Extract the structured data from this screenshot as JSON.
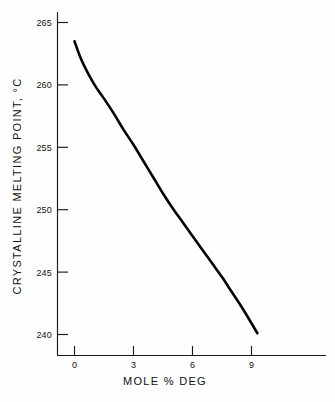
{
  "chart_data": {
    "type": "line",
    "title": "",
    "xlabel": "MOLE % DEG",
    "ylabel": "CRYSTALLINE MELTING POINT, °C",
    "xlim": [
      -0.9,
      10.2
    ],
    "ylim": [
      238.0,
      266.2
    ],
    "grid": false,
    "legend": null,
    "xticks": [
      0,
      3,
      6,
      9
    ],
    "xtick_labels": [
      "0",
      "3",
      "6",
      "9"
    ],
    "yticks": [
      240,
      245,
      250,
      255,
      260,
      265
    ],
    "ytick_labels": [
      "240",
      "245",
      "250",
      "255",
      "260",
      "265"
    ],
    "series": [
      {
        "name": "crystalline melting point",
        "color": "#050505",
        "x": [
          0.0,
          0.25,
          0.5,
          0.8,
          1.1,
          1.5,
          2.0,
          2.5,
          3.0,
          3.5,
          4.0,
          4.5,
          5.0,
          5.5,
          6.0,
          6.5,
          7.0,
          7.5,
          8.0,
          8.5,
          9.0,
          9.3
        ],
        "y": [
          263.5,
          262.4,
          261.5,
          260.6,
          259.8,
          258.9,
          257.7,
          256.4,
          255.2,
          253.9,
          252.6,
          251.3,
          250.1,
          249.0,
          247.9,
          246.8,
          245.7,
          244.6,
          243.4,
          242.2,
          240.9,
          240.1
        ]
      }
    ]
  },
  "axes": {
    "x_axis_label": "MOLE % DEG",
    "y_axis_label": "CRYSTALLINE MELTING POINT, °C"
  }
}
